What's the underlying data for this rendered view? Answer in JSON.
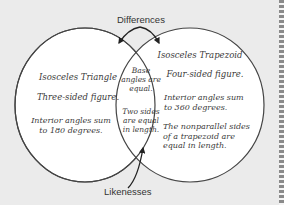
{
  "diagram": {
    "type": "venn",
    "labels": {
      "top": "Differences",
      "bottom": "Likenesses"
    },
    "left_set": {
      "title": "Isosceles Triangle",
      "facts": [
        "Three-sided figure.",
        "Interior angles sum to 180 degrees."
      ]
    },
    "right_set": {
      "title": "Isosceles Trapezoid",
      "facts": [
        "Four-sided figure.",
        "Interior angles sum to 360 degrees.",
        "The nonparallel sides of a trapezoid are equal in length."
      ]
    },
    "intersection": {
      "facts": [
        "Base angles are equal.",
        "Two sides are equal in length."
      ]
    },
    "colors": {
      "background": "#ebebeb",
      "circle_fill": "#ffffff",
      "stroke": "#444444"
    }
  }
}
